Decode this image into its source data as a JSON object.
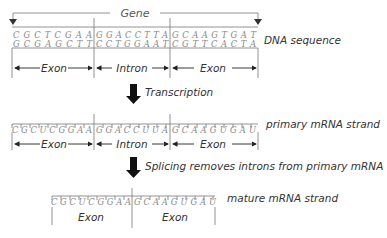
{
  "gene_label": "Gene",
  "dna": {
    "label": "DNA sequence",
    "top_strand": [
      "C",
      "G",
      "C",
      "T",
      "C",
      "G",
      "A",
      "A",
      "G",
      "G",
      "A",
      "C",
      "C",
      "T",
      "T",
      "A",
      "G",
      "C",
      "A",
      "A",
      "G",
      "T",
      "G",
      "A",
      "T"
    ],
    "bottom_strand": [
      "G",
      "C",
      "G",
      "A",
      "G",
      "C",
      "T",
      "T",
      "C",
      "C",
      "T",
      "G",
      "G",
      "A",
      "A",
      "T",
      "C",
      "G",
      "T",
      "T",
      "C",
      "A",
      "C",
      "T",
      "A"
    ],
    "segments": [
      "Exon",
      "Intron",
      "Exon"
    ]
  },
  "step1": {
    "label": "Transcription"
  },
  "primary_mrna": {
    "label": "primary mRNA strand",
    "strand": [
      "C",
      "G",
      "C",
      "U",
      "C",
      "G",
      "G",
      "A",
      "A",
      "G",
      "G",
      "A",
      "C",
      "C",
      "U",
      "U",
      "A",
      "G",
      "C",
      "A",
      "A",
      "G",
      "U",
      "G",
      "A",
      "U"
    ],
    "segments": [
      "Exon",
      "Intron",
      "Exon"
    ]
  },
  "step2": {
    "label": "Splicing removes introns from primary mRNA"
  },
  "mature_mrna": {
    "label": "mature mRNA strand",
    "strand": [
      "C",
      "G",
      "C",
      "U",
      "C",
      "G",
      "G",
      "A",
      "A",
      "G",
      "C",
      "A",
      "A",
      "G",
      "U",
      "G",
      "A",
      "U"
    ],
    "segments": [
      "Exon",
      "Exon"
    ]
  },
  "strings": {
    "dna_top_1": "C G C T C G A A",
    "dna_top_2": "G G A C C T T A",
    "dna_top_3": "G C A A G T G A T",
    "dna_bot_1": "G C G A G C T T",
    "dna_bot_2": "C C T G G A A T",
    "dna_bot_3": "C G T T C A C T A",
    "pm_1": "C G C U C G G A A",
    "pm_2": "G G A C C U U A",
    "pm_3": "G C A A G U G A U",
    "mm_1": "C G C U C G G A A",
    "mm_2": "G C A A G U G A U"
  }
}
